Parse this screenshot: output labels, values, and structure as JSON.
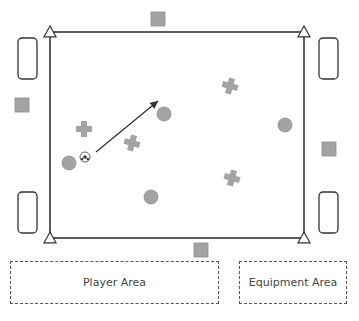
{
  "diagram": {
    "title": "",
    "colors": {
      "field_line": "#333333",
      "marker_fill": "#a3a3a3",
      "marker_stroke": "#8c8c8c",
      "zone_border": "#555555",
      "text": "#444444"
    },
    "field": {
      "x1": 50,
      "y1": 32,
      "x2": 304,
      "y2": 238
    },
    "corner_markers": [
      {
        "id": "tl",
        "icon": "triangle-cone-icon",
        "x": 50,
        "y": 32
      },
      {
        "id": "tr",
        "icon": "triangle-cone-icon",
        "x": 304,
        "y": 32
      },
      {
        "id": "bl",
        "icon": "triangle-cone-icon",
        "x": 50,
        "y": 238
      },
      {
        "id": "br",
        "icon": "triangle-cone-icon",
        "x": 304,
        "y": 238
      }
    ],
    "goals": [
      {
        "id": "left-top",
        "x": 18,
        "y": 38,
        "w": 19,
        "h": 41
      },
      {
        "id": "left-bottom",
        "x": 18,
        "y": 192,
        "w": 19,
        "h": 41
      },
      {
        "id": "right-top",
        "x": 319,
        "y": 38,
        "w": 19,
        "h": 41
      },
      {
        "id": "right-bottom",
        "x": 319,
        "y": 192,
        "w": 19,
        "h": 41
      }
    ],
    "squares": [
      {
        "id": "top",
        "x": 151,
        "y": 12,
        "size": 14
      },
      {
        "id": "left",
        "x": 15,
        "y": 98,
        "size": 14
      },
      {
        "id": "right",
        "x": 322,
        "y": 142,
        "size": 14
      },
      {
        "id": "bottom",
        "x": 194,
        "y": 243,
        "size": 14
      }
    ],
    "circles": [
      {
        "id": "p1",
        "cx": 69,
        "cy": 163,
        "r": 7
      },
      {
        "id": "p2",
        "cx": 164,
        "cy": 114,
        "r": 7
      },
      {
        "id": "p3",
        "cx": 285,
        "cy": 125,
        "r": 7
      },
      {
        "id": "p4",
        "cx": 151,
        "cy": 197,
        "r": 7
      }
    ],
    "crosses": [
      {
        "id": "x1",
        "cx": 84,
        "cy": 129,
        "size": 16,
        "rot": 0
      },
      {
        "id": "x2",
        "cx": 132,
        "cy": 143,
        "size": 16,
        "rot": 15
      },
      {
        "id": "x3",
        "cx": 230,
        "cy": 86,
        "size": 16,
        "rot": 15
      },
      {
        "id": "x4",
        "cx": 232,
        "cy": 178,
        "size": 16,
        "rot": 15
      }
    ],
    "ball": {
      "cx": 85,
      "cy": 157,
      "r": 5
    },
    "pass_arrow": {
      "x1": 96,
      "y1": 152,
      "x2": 158,
      "y2": 101
    },
    "zones": {
      "player_area": {
        "label": "Player Area"
      },
      "equipment_area": {
        "label": "Equipment Area"
      }
    }
  }
}
